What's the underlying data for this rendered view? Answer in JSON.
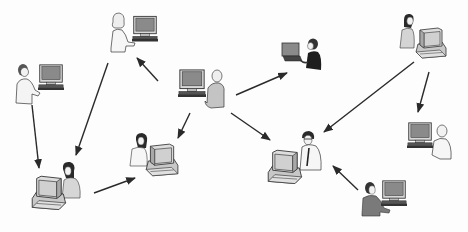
{
  "diagram": {
    "type": "network-of-computer-users",
    "background": "#ffffff",
    "line_color": "#2a2a2a",
    "nodes": [
      {
        "id": "man-standing-laptop-left",
        "x": 40,
        "y": 88,
        "kind": "standing-man-with-crt-monitor"
      },
      {
        "id": "woman-standing-top",
        "x": 135,
        "y": 35,
        "kind": "standing-woman-with-crt-monitor"
      },
      {
        "id": "bald-man-center",
        "x": 200,
        "y": 85,
        "kind": "seated-man-with-crt-monitor"
      },
      {
        "id": "man-laptop-top-center",
        "x": 300,
        "y": 57,
        "kind": "man-with-laptop"
      },
      {
        "id": "woman-desktop-top-right",
        "x": 418,
        "y": 40,
        "kind": "woman-at-desktop-computer"
      },
      {
        "id": "woman-desktop-bottom-left",
        "x": 58,
        "y": 187,
        "kind": "woman-at-desktop-computer"
      },
      {
        "id": "woman-desktop-center-left",
        "x": 152,
        "y": 150,
        "kind": "woman-at-desktop-computer"
      },
      {
        "id": "man-glasses-desktop-center",
        "x": 298,
        "y": 160,
        "kind": "man-with-glasses-at-desktop"
      },
      {
        "id": "man-seated-right",
        "x": 427,
        "y": 138,
        "kind": "seated-man-with-crt-monitor"
      },
      {
        "id": "man-seated-bottom-right",
        "x": 383,
        "y": 197,
        "kind": "seated-man-with-crt-monitor"
      }
    ],
    "arrows": [
      {
        "from": "man-standing-laptop-left",
        "to": "woman-desktop-bottom-left",
        "x1": 32,
        "y1": 105,
        "x2": 39,
        "y2": 168
      },
      {
        "from": "woman-standing-top",
        "to": "woman-desktop-bottom-left",
        "x1": 108,
        "y1": 63,
        "x2": 76,
        "y2": 155
      },
      {
        "from": "bald-man-center",
        "to": "woman-standing-top",
        "x1": 158,
        "y1": 81,
        "x2": 137,
        "y2": 58
      },
      {
        "from": "bald-man-center",
        "to": "man-laptop-top-center",
        "x1": 236,
        "y1": 95,
        "x2": 287,
        "y2": 73
      },
      {
        "from": "bald-man-center",
        "to": "woman-desktop-center-left",
        "x1": 190,
        "y1": 113,
        "x2": 178,
        "y2": 138
      },
      {
        "from": "bald-man-center",
        "to": "man-glasses-desktop-center",
        "x1": 231,
        "y1": 113,
        "x2": 270,
        "y2": 140
      },
      {
        "from": "woman-desktop-bottom-left",
        "to": "woman-desktop-center-left",
        "x1": 94,
        "y1": 193,
        "x2": 135,
        "y2": 178
      },
      {
        "from": "woman-desktop-top-right",
        "to": "man-glasses-desktop-center",
        "x1": 414,
        "y1": 62,
        "x2": 324,
        "y2": 132
      },
      {
        "from": "woman-desktop-top-right",
        "to": "man-seated-right",
        "x1": 429,
        "y1": 72,
        "x2": 418,
        "y2": 112
      },
      {
        "from": "man-seated-bottom-right",
        "to": "man-glasses-desktop-center",
        "x1": 358,
        "y1": 190,
        "x2": 333,
        "y2": 166
      }
    ]
  }
}
